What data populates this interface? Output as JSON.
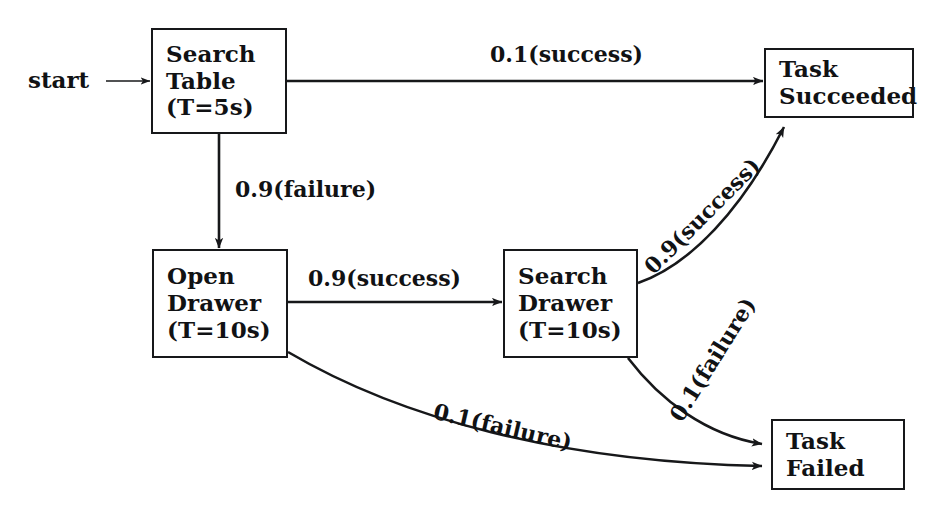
{
  "diagram": {
    "type": "state-transition-diagram",
    "background_color": "#ffffff",
    "stroke_color": "#17181a",
    "text_color": "#111214",
    "start": {
      "label": "start"
    },
    "nodes": [
      {
        "id": "search-table",
        "lines": [
          "Search",
          "Table",
          "(T=5s)"
        ],
        "line1": "Search",
        "line2": "Table",
        "line3": "(T=5s)",
        "duration": "5s"
      },
      {
        "id": "task-succeeded",
        "lines": [
          "Task",
          "Succeeded"
        ],
        "line1": "Task",
        "line2": "Succeeded"
      },
      {
        "id": "open-drawer",
        "lines": [
          "Open",
          "Drawer",
          "(T=10s)"
        ],
        "line1": "Open",
        "line2": "Drawer",
        "line3": "(T=10s)",
        "duration": "10s"
      },
      {
        "id": "search-drawer",
        "lines": [
          "Search",
          "Drawer",
          "(T=10s)"
        ],
        "line1": "Search",
        "line2": "Drawer",
        "line3": "(T=10s)",
        "duration": "10s"
      },
      {
        "id": "task-failed",
        "lines": [
          "Task",
          "Failed"
        ],
        "line1": "Task",
        "line2": "Failed"
      }
    ],
    "edges": [
      {
        "id": "start-to-search-table",
        "from": "start",
        "to": "search-table",
        "label": ""
      },
      {
        "id": "search-table-to-task-succeeded",
        "from": "search-table",
        "to": "task-succeeded",
        "label": "0.1(success)",
        "probability": 0.1,
        "outcome": "success"
      },
      {
        "id": "search-table-to-open-drawer",
        "from": "search-table",
        "to": "open-drawer",
        "label": "0.9(failure)",
        "probability": 0.9,
        "outcome": "failure"
      },
      {
        "id": "open-drawer-to-search-drawer",
        "from": "open-drawer",
        "to": "search-drawer",
        "label": "0.9(success)",
        "probability": 0.9,
        "outcome": "success"
      },
      {
        "id": "open-drawer-to-task-failed",
        "from": "open-drawer",
        "to": "task-failed",
        "label": "0.1(failure)",
        "probability": 0.1,
        "outcome": "failure"
      },
      {
        "id": "search-drawer-to-task-succeeded",
        "from": "search-drawer",
        "to": "task-succeeded",
        "label": "0.9(success)",
        "probability": 0.9,
        "outcome": "success"
      },
      {
        "id": "search-drawer-to-task-failed",
        "from": "search-drawer",
        "to": "task-failed",
        "label": "0.1(failure)",
        "probability": 0.1,
        "outcome": "failure"
      }
    ]
  }
}
